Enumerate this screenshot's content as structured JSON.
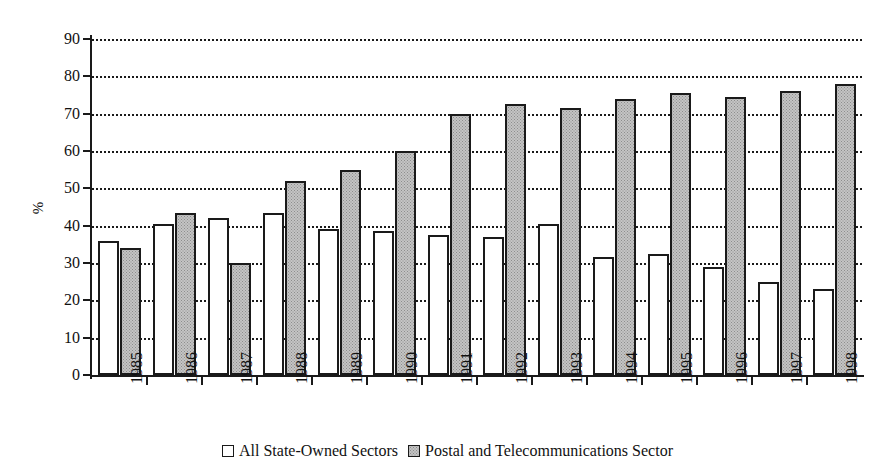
{
  "chart_data": {
    "type": "bar",
    "title": "",
    "xlabel": "",
    "ylabel": "%",
    "ylim": [
      0,
      90
    ],
    "ytick_step": 10,
    "yticks": [
      0,
      10,
      20,
      30,
      40,
      50,
      60,
      70,
      80,
      90
    ],
    "grid": true,
    "grid_style": "dotted-horizontal",
    "legend_position": "bottom-center",
    "categories": [
      "1985",
      "1986",
      "1987",
      "1988",
      "1989",
      "1990",
      "1991",
      "1992",
      "1993",
      "1994",
      "1995",
      "1996",
      "1997",
      "1998"
    ],
    "series": [
      {
        "name": "All State-Owned Sectors",
        "fill": "white",
        "color": "#ffffff",
        "values": [
          36,
          40.5,
          42,
          43.5,
          39,
          38.5,
          37.5,
          37,
          40.5,
          31.5,
          32.5,
          29,
          25,
          23
        ]
      },
      {
        "name": "Postal and Telecommunications Sector",
        "fill": "gray-stipple",
        "color": "#c4c4c4",
        "values": [
          34,
          43.5,
          30,
          52,
          55,
          60,
          70,
          72.5,
          71.5,
          74,
          75.5,
          74.5,
          76,
          78
        ]
      }
    ]
  },
  "legend": {
    "entries": [
      {
        "label": "All State-Owned Sectors"
      },
      {
        "label": "Postal and Telecommunications Sector"
      }
    ]
  },
  "axis": {
    "y_title": "%"
  }
}
